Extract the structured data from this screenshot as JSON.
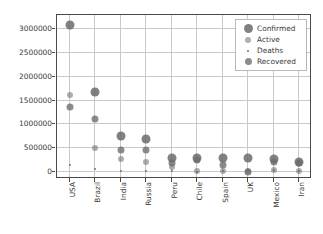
{
  "chart_data": {
    "type": "scatter",
    "title": "",
    "xlabel": "",
    "ylabel": "",
    "categories": [
      "USA",
      "Brazil",
      "India",
      "Russia",
      "Peru",
      "Chile",
      "Spain",
      "UK",
      "Mexico",
      "Iran"
    ],
    "ylim": [
      -150000,
      3300000
    ],
    "yticks": [
      0,
      500000,
      1000000,
      1500000,
      2000000,
      2500000,
      3000000
    ],
    "ytick_labels": [
      "0",
      "500000",
      "1000000",
      "1500000",
      "2000000",
      "2500000",
      "3000000"
    ],
    "grid": true,
    "legend_position": "upper right",
    "marker_color": "#6b6b6b",
    "series": [
      {
        "name": "Confirmed",
        "marker_size": 9,
        "values": [
          3100000,
          1670000,
          745000,
          690000,
          300000,
          285000,
          295000,
          285000,
          270000,
          215000
        ]
      },
      {
        "name": "Active",
        "marker_size": 6,
        "values": [
          1610000,
          495000,
          265000,
          215000,
          95000,
          15000,
          15000,
          15000,
          35000,
          15000
        ]
      },
      {
        "name": "Deaths",
        "marker_size": 2,
        "values": [
          135000,
          65000,
          20000,
          10000,
          10000,
          6000,
          28000,
          44000,
          32000,
          10000
        ]
      },
      {
        "name": "Recovered",
        "marker_size": 7,
        "values": [
          1355000,
          1115000,
          455000,
          465000,
          190000,
          255000,
          150000,
          1000,
          200000,
          180000
        ]
      }
    ]
  },
  "legend": {
    "entries": [
      {
        "label": "Confirmed"
      },
      {
        "label": "Active"
      },
      {
        "label": "Deaths"
      },
      {
        "label": "Recovered"
      }
    ]
  }
}
